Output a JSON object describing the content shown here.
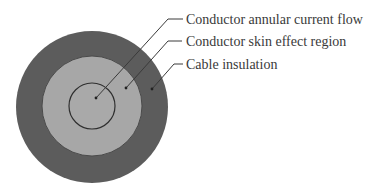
{
  "diagram": {
    "layers": [
      {
        "name": "Cable insulation",
        "color": "#5c5c5c"
      },
      {
        "name": "Conductor skin effect region",
        "color": "#a7a7a7"
      },
      {
        "name": "Conductor annular current flow",
        "color": "#a9a9a9"
      }
    ],
    "labels": [
      {
        "text": "Conductor annular current flow"
      },
      {
        "text": "Conductor skin effect region"
      },
      {
        "text": "Cable insulation"
      }
    ],
    "line_color": "#3a3a3a"
  }
}
